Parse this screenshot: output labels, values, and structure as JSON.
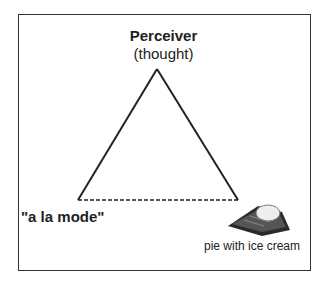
{
  "diagram": {
    "apex": {
      "title": "Perceiver",
      "subtitle": "(thought)"
    },
    "left_vertex": {
      "label": "\"a la mode\""
    },
    "right_vertex": {
      "label": "pie with ice cream",
      "image": "pie-with-ice-cream-icon"
    },
    "edges": [
      {
        "from": "apex",
        "to": "left_vertex",
        "style": "solid"
      },
      {
        "from": "apex",
        "to": "right_vertex",
        "style": "solid"
      },
      {
        "from": "left_vertex",
        "to": "right_vertex",
        "style": "dashed"
      }
    ]
  }
}
